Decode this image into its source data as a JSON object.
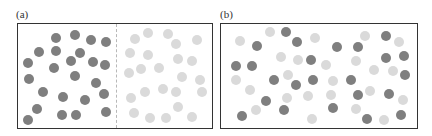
{
  "panels": [
    {
      "id": "a",
      "label": "(a)",
      "label_pos": [
        16,
        9
      ],
      "box": {
        "x": 17,
        "y": 23,
        "w": 196,
        "h": 106
      },
      "divider": {
        "x": 116,
        "y": 24,
        "h": 104,
        "style": "dashed"
      },
      "description": "Two species separated: dark particles on left half, light particles on right half",
      "particles": [
        {
          "c": "dark",
          "x": 56,
          "y": 38
        },
        {
          "c": "dark",
          "x": 75,
          "y": 35
        },
        {
          "c": "dark",
          "x": 91,
          "y": 40
        },
        {
          "c": "dark",
          "x": 106,
          "y": 42
        },
        {
          "c": "dark",
          "x": 39,
          "y": 52
        },
        {
          "c": "dark",
          "x": 56,
          "y": 51
        },
        {
          "c": "dark",
          "x": 80,
          "y": 53
        },
        {
          "c": "dark",
          "x": 28,
          "y": 63
        },
        {
          "c": "dark",
          "x": 54,
          "y": 68
        },
        {
          "c": "dark",
          "x": 71,
          "y": 61
        },
        {
          "c": "dark",
          "x": 93,
          "y": 62
        },
        {
          "c": "dark",
          "x": 105,
          "y": 65
        },
        {
          "c": "dark",
          "x": 29,
          "y": 79
        },
        {
          "c": "dark",
          "x": 75,
          "y": 76
        },
        {
          "c": "dark",
          "x": 96,
          "y": 83
        },
        {
          "c": "dark",
          "x": 43,
          "y": 92
        },
        {
          "c": "dark",
          "x": 63,
          "y": 97
        },
        {
          "c": "dark",
          "x": 85,
          "y": 100
        },
        {
          "c": "dark",
          "x": 104,
          "y": 94
        },
        {
          "c": "dark",
          "x": 37,
          "y": 109
        },
        {
          "c": "dark",
          "x": 62,
          "y": 115
        },
        {
          "c": "dark",
          "x": 76,
          "y": 115
        },
        {
          "c": "dark",
          "x": 106,
          "y": 112
        },
        {
          "c": "dark",
          "x": 28,
          "y": 120
        },
        {
          "c": "light",
          "x": 135,
          "y": 39
        },
        {
          "c": "light",
          "x": 148,
          "y": 33
        },
        {
          "c": "light",
          "x": 168,
          "y": 34
        },
        {
          "c": "light",
          "x": 176,
          "y": 44
        },
        {
          "c": "light",
          "x": 197,
          "y": 40
        },
        {
          "c": "light",
          "x": 130,
          "y": 53
        },
        {
          "c": "light",
          "x": 148,
          "y": 55
        },
        {
          "c": "light",
          "x": 178,
          "y": 59
        },
        {
          "c": "light",
          "x": 192,
          "y": 61
        },
        {
          "c": "light",
          "x": 129,
          "y": 73
        },
        {
          "c": "light",
          "x": 141,
          "y": 69
        },
        {
          "c": "light",
          "x": 159,
          "y": 68
        },
        {
          "c": "light",
          "x": 182,
          "y": 77
        },
        {
          "c": "light",
          "x": 200,
          "y": 80
        },
        {
          "c": "light",
          "x": 145,
          "y": 92
        },
        {
          "c": "light",
          "x": 163,
          "y": 89
        },
        {
          "c": "light",
          "x": 176,
          "y": 92
        },
        {
          "c": "light",
          "x": 202,
          "y": 92
        },
        {
          "c": "light",
          "x": 131,
          "y": 98
        },
        {
          "c": "light",
          "x": 178,
          "y": 107
        },
        {
          "c": "light",
          "x": 134,
          "y": 113
        },
        {
          "c": "light",
          "x": 150,
          "y": 118
        },
        {
          "c": "light",
          "x": 166,
          "y": 118
        },
        {
          "c": "light",
          "x": 192,
          "y": 117
        }
      ]
    },
    {
      "id": "b",
      "label": "(b)",
      "label_pos": [
        220,
        9
      ],
      "box": {
        "x": 220,
        "y": 23,
        "w": 198,
        "h": 106
      },
      "description": "Two species mixed: dark and light particles distributed throughout",
      "particles": [
        {
          "c": "light",
          "x": 240,
          "y": 41
        },
        {
          "c": "light",
          "x": 270,
          "y": 32
        },
        {
          "c": "dark",
          "x": 286,
          "y": 32
        },
        {
          "c": "dark",
          "x": 297,
          "y": 42
        },
        {
          "c": "light",
          "x": 315,
          "y": 38
        },
        {
          "c": "dark",
          "x": 257,
          "y": 46
        },
        {
          "c": "light",
          "x": 281,
          "y": 57
        },
        {
          "c": "light",
          "x": 298,
          "y": 60
        },
        {
          "c": "dark",
          "x": 311,
          "y": 60
        },
        {
          "c": "dark",
          "x": 236,
          "y": 66
        },
        {
          "c": "dark",
          "x": 252,
          "y": 66
        },
        {
          "c": "light",
          "x": 236,
          "y": 80
        },
        {
          "c": "dark",
          "x": 274,
          "y": 80
        },
        {
          "c": "light",
          "x": 288,
          "y": 75
        },
        {
          "c": "dark",
          "x": 296,
          "y": 85
        },
        {
          "c": "dark",
          "x": 313,
          "y": 80
        },
        {
          "c": "light",
          "x": 250,
          "y": 90
        },
        {
          "c": "light",
          "x": 287,
          "y": 98
        },
        {
          "c": "light",
          "x": 308,
          "y": 96
        },
        {
          "c": "dark",
          "x": 266,
          "y": 101
        },
        {
          "c": "light",
          "x": 256,
          "y": 110
        },
        {
          "c": "dark",
          "x": 284,
          "y": 110
        },
        {
          "c": "dark",
          "x": 242,
          "y": 116
        },
        {
          "c": "light",
          "x": 312,
          "y": 119
        },
        {
          "c": "dark",
          "x": 337,
          "y": 47
        },
        {
          "c": "dark",
          "x": 358,
          "y": 47
        },
        {
          "c": "light",
          "x": 365,
          "y": 36
        },
        {
          "c": "dark",
          "x": 386,
          "y": 36
        },
        {
          "c": "light",
          "x": 399,
          "y": 42
        },
        {
          "c": "light",
          "x": 326,
          "y": 65
        },
        {
          "c": "light",
          "x": 356,
          "y": 61
        },
        {
          "c": "dark",
          "x": 386,
          "y": 58
        },
        {
          "c": "dark",
          "x": 404,
          "y": 56
        },
        {
          "c": "light",
          "x": 333,
          "y": 81
        },
        {
          "c": "dark",
          "x": 351,
          "y": 80
        },
        {
          "c": "light",
          "x": 374,
          "y": 70
        },
        {
          "c": "light",
          "x": 393,
          "y": 71
        },
        {
          "c": "dark",
          "x": 405,
          "y": 75
        },
        {
          "c": "light",
          "x": 331,
          "y": 95
        },
        {
          "c": "dark",
          "x": 358,
          "y": 95
        },
        {
          "c": "light",
          "x": 370,
          "y": 91
        },
        {
          "c": "dark",
          "x": 389,
          "y": 94
        },
        {
          "c": "light",
          "x": 403,
          "y": 100
        },
        {
          "c": "dark",
          "x": 333,
          "y": 108
        },
        {
          "c": "light",
          "x": 356,
          "y": 109
        },
        {
          "c": "dark",
          "x": 367,
          "y": 119
        },
        {
          "c": "light",
          "x": 384,
          "y": 120
        },
        {
          "c": "dark",
          "x": 401,
          "y": 115
        }
      ]
    }
  ],
  "colors": {
    "dark_particle": "#7f7f7f",
    "light_particle": "#dadada",
    "border": "#333333",
    "divider": "#b8b8b8"
  }
}
